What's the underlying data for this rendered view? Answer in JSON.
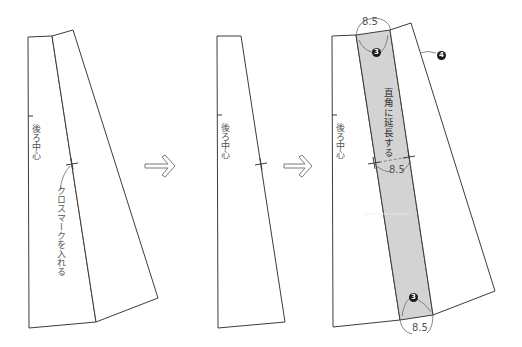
{
  "diagram": {
    "type": "sewing-pattern-steps",
    "colors": {
      "line": "#3c3c3c",
      "band_fill": "#d3d3d3",
      "label": "#555555",
      "arrow": "#7a7a7a"
    },
    "panels": [
      {
        "id": "step1",
        "center_back_label": "後ろ中心",
        "instruction": "クロスマークを入れる"
      },
      {
        "id": "step2",
        "center_back_label": "後ろ中心"
      },
      {
        "id": "step3",
        "center_back_label": "後ろ中心",
        "band_instruction": "直角に延長する",
        "top_width": "8.5",
        "middle_width": "8.5",
        "bottom_width": "8.5",
        "top_marker": "3",
        "bottom_marker": "3",
        "side_marker": "4"
      }
    ],
    "arrows": [
      "next-step-arrow",
      "next-step-arrow"
    ]
  }
}
